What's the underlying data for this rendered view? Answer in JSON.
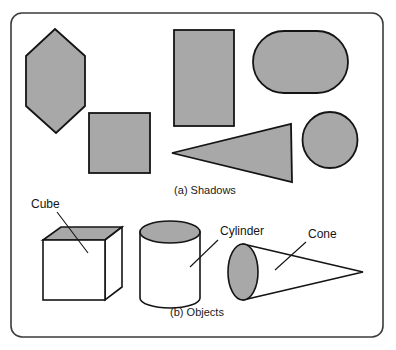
{
  "figure": {
    "frame": {
      "x": 11,
      "y": 13,
      "width": 372,
      "height": 324,
      "radius": 11,
      "stroke": "#3b3b3b",
      "stroke_width": 1.6,
      "fill": "#ffffff"
    },
    "colors": {
      "shadow_fill": "#a8a8a8",
      "outline": "#141414",
      "object_fill": "#ffffff",
      "text": "#151515",
      "background": "#ffffff"
    },
    "panels": [
      {
        "id": "a",
        "caption": "(a)  Shadows",
        "caption_x": 205,
        "caption_y": 194,
        "shapes": [
          {
            "name": "hexagon-shadow",
            "type": "polygon",
            "points": "55,29 85,56 85,106 56,133 26,106 26,56"
          },
          {
            "name": "square-shadow",
            "type": "rect",
            "x": 89,
            "y": 113,
            "width": 61,
            "height": 60
          },
          {
            "name": "rectangle-shadow",
            "type": "rect",
            "x": 174,
            "y": 30,
            "width": 60,
            "height": 96
          },
          {
            "name": "stadium-shadow",
            "type": "rounded-rect",
            "x": 253,
            "y": 31,
            "width": 95,
            "height": 62,
            "radius": 31
          },
          {
            "name": "triangle-shadow",
            "type": "polygon",
            "points": "172,153 291,124 292,182"
          },
          {
            "name": "circle-shadow",
            "type": "ellipse",
            "cx": 330,
            "cy": 140,
            "rx": 27.5,
            "ry": 28
          }
        ]
      },
      {
        "id": "b",
        "caption": "(b)  Objects",
        "caption_x": 197,
        "caption_y": 316,
        "objects": [
          {
            "name": "cube",
            "label": "Cube",
            "label_x": 31,
            "label_y": 208,
            "leader": "57,212 88,253"
          },
          {
            "name": "cylinder",
            "label": "Cylinder",
            "label_x": 220,
            "label_y": 235,
            "leader": "218,240 190,267"
          },
          {
            "name": "cone",
            "label": "Cone",
            "label_x": 308,
            "label_y": 238,
            "leader": "306,242 275,270"
          }
        ]
      }
    ]
  }
}
